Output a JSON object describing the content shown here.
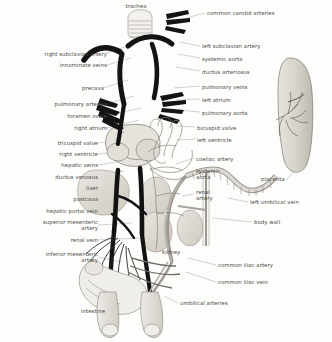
{
  "figure": {
    "ink_color": "#2b2b2b",
    "label_color": "#4a4a4a",
    "leader_color": "#8a8a8a",
    "background": "#fdfdfb",
    "organ_fill": "#dedad2",
    "vessel_dark": "#1a1a1a",
    "vessel_light": "#b9b4ab"
  },
  "labels": {
    "top": [
      {
        "id": "trachea",
        "text": "trachea",
        "align": "c",
        "x": 136,
        "y": 5
      }
    ],
    "left": [
      {
        "id": "right-subclavian-artery",
        "text": "right subclavian artery",
        "align": "r",
        "x": 20,
        "y": 54
      },
      {
        "id": "innominate-veins",
        "text": "innominate veins",
        "align": "r",
        "x": 42,
        "y": 66
      },
      {
        "id": "precava",
        "text": "precava",
        "align": "r",
        "x": 68,
        "y": 89
      },
      {
        "id": "pulmonary-arteries",
        "text": "pulmonary arteries",
        "align": "r",
        "x": 32,
        "y": 105
      },
      {
        "id": "foramen-ovale",
        "text": "foramen ovale",
        "align": "r",
        "x": 48,
        "y": 117
      },
      {
        "id": "right-atrium",
        "text": "right atrium",
        "align": "r",
        "x": 57,
        "y": 129
      },
      {
        "id": "tricuspid-valve",
        "text": "tricuspid valve",
        "align": "r",
        "x": 25,
        "y": 144
      },
      {
        "id": "right-ventricle",
        "text": "right ventricle",
        "align": "r",
        "x": 25,
        "y": 155
      },
      {
        "id": "hepatic-veins",
        "text": "hepatic veins",
        "align": "r",
        "x": 28,
        "y": 166
      },
      {
        "id": "ductus-venosus",
        "text": "ductus venosus",
        "align": "r",
        "x": 22,
        "y": 178
      },
      {
        "id": "liver",
        "text": "liver",
        "align": "r",
        "x": 55,
        "y": 189
      },
      {
        "id": "postcava",
        "text": "postcava",
        "align": "r",
        "x": 43,
        "y": 200
      },
      {
        "id": "hepatic-portal-vein",
        "text": "hepatic portal vein",
        "align": "r",
        "x": 12,
        "y": 212
      },
      {
        "id": "superior-mesenteric-artery",
        "text": "superior mesenteric\nartery",
        "align": "r",
        "x": 8,
        "y": 223
      },
      {
        "id": "renal-vein",
        "text": "renal vein",
        "align": "r",
        "x": 39,
        "y": 241
      },
      {
        "id": "inferior-mesenteric-artery",
        "text": "inferior mesenteric\nartery",
        "align": "r",
        "x": 6,
        "y": 255
      },
      {
        "id": "intestine",
        "text": "intestine",
        "align": "r",
        "x": 72,
        "y": 312
      }
    ],
    "right": [
      {
        "id": "common-carotid-arteries",
        "text": "common carotid arteries",
        "align": "l",
        "x": 207,
        "y": 13
      },
      {
        "id": "left-subclavian-artery",
        "text": "left subclavian artery",
        "align": "l",
        "x": 202,
        "y": 46
      },
      {
        "id": "systemic-aorta",
        "text": "systemic aorta",
        "align": "l",
        "x": 202,
        "y": 59
      },
      {
        "id": "ductus-arteriosus",
        "text": "ductus arteriosus",
        "align": "l",
        "x": 202,
        "y": 72
      },
      {
        "id": "pulmonary-veins",
        "text": "pulmonary veins",
        "align": "l",
        "x": 202,
        "y": 87
      },
      {
        "id": "left-atrium",
        "text": "left atrium",
        "align": "l",
        "x": 202,
        "y": 100
      },
      {
        "id": "pulmonary-aorta",
        "text": "pulmonary aorta",
        "align": "l",
        "x": 202,
        "y": 113
      },
      {
        "id": "bicuspid-valve",
        "text": "bicuspid valve",
        "align": "l",
        "x": 197,
        "y": 128
      },
      {
        "id": "left-ventricle",
        "text": "left ventricle",
        "align": "l",
        "x": 197,
        "y": 140
      },
      {
        "id": "coeliac-artery",
        "text": "coeliac artery",
        "align": "l",
        "x": 196,
        "y": 159
      },
      {
        "id": "systemic-aorta-lower",
        "text": "systemic\naorta",
        "align": "l",
        "x": 196,
        "y": 171
      },
      {
        "id": "renal-artery",
        "text": "renal\nartery",
        "align": "l",
        "x": 196,
        "y": 192
      },
      {
        "id": "placenta",
        "text": "placenta",
        "align": "l",
        "x": 261,
        "y": 179
      },
      {
        "id": "left-umbilical-vein",
        "text": "left umbilical vein",
        "align": "l",
        "x": 250,
        "y": 202
      },
      {
        "id": "body-wall",
        "text": "body wall",
        "align": "l",
        "x": 254,
        "y": 222
      },
      {
        "id": "common-iliac-artery",
        "text": "common iliac artery",
        "align": "l",
        "x": 218,
        "y": 265
      },
      {
        "id": "common-iliac-vein",
        "text": "common iliac vein",
        "align": "l",
        "x": 218,
        "y": 282
      },
      {
        "id": "umbilical-arteries",
        "text": "umbilical arteries",
        "align": "l",
        "x": 180,
        "y": 303
      },
      {
        "id": "kidney",
        "text": "kidney",
        "align": "l",
        "x": 162,
        "y": 252
      }
    ]
  }
}
